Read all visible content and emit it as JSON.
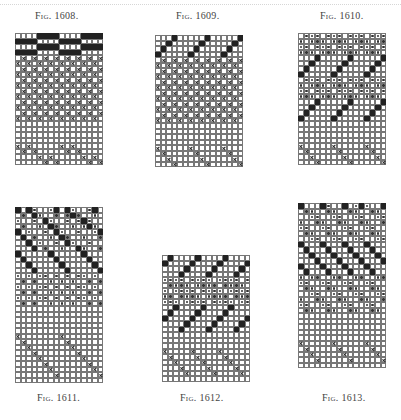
{
  "page": {
    "legend": {
      ".": "empty square",
      "#": "filled square",
      "x": "cross",
      "*": "dot"
    }
  },
  "figures": [
    {
      "id": "fig-1608",
      "caption": "Fig. 1608.",
      "left": 15,
      "top": 33,
      "caption_left": 35,
      "caption_top": 10,
      "rows": [
        "....####....####",
        "####....####....",
        "....####....####",
        "####....####....",
        ".x.x.x.x.x.x.x.x",
        "x.x.x.x.x.x.x.x.",
        ".x.x.x.x.x.x.x.x",
        "x.x.x.x.x.x.x.x.",
        ".x.x.x.x.x.x.x.x",
        "x.x.x.x.x.x.x.x.",
        ".x.x.x.x.x.x.x.x",
        "x.x.x.x.x.x.x.x.",
        ".x.x.x.x.x.x.x.x",
        "x.x.x.x.x.x.x.x.",
        ".x.x.x.x.x.x.x.x",
        "x.x.x.x.x.x.x.x.",
        "................",
        "................",
        "................",
        "................",
        "x.x.....x.x.....",
        ".x.x.....x.x....",
        "....x.x.....x.x.",
        ".....x.x.....x.x"
      ]
    },
    {
      "id": "fig-1609",
      "caption": "Fig. 1609.",
      "left": 155,
      "top": 35,
      "caption_left": 176,
      "caption_top": 10,
      "rows": [
        "...#.....#.....#",
        "..#.....#.....#.",
        ".#.....#.....#..",
        "#.....#.....#...",
        ".x.x.x.x.x.x.x.x",
        "x.x.x.x.x.x.x.x.",
        ".x.x.x.x.x.x.x.x",
        "x.x.x.x.x.x.x.x.",
        ".x.x.x.x.x.x.x.x",
        "x.x.x.x.x.x.x.x.",
        ".x.x.x.x.x.x.x.x",
        "x.x.x.x.x.x.x.x.",
        ".x.x.x.x.x.x.x.x",
        "x.x.x.x.x.x.x.x.",
        ".x.x.x.x.x.x.x.x",
        "x.x.x.x.x.x.x.x.",
        "................",
        "................",
        "................",
        "................",
        "x.....x.....x...",
        ".x.....x.....x..",
        "..x.....x.....x.",
        "...x.....x.....x"
      ]
    },
    {
      "id": "fig-1610",
      "caption": "Fig. 1610.",
      "left": 298,
      "top": 33,
      "caption_left": 320,
      "caption_top": 10,
      "rows": [
        ".***.***.***.***",
        "*.***.***.***.**",
        "**.***.***.***.*",
        "***.***.***.***.",
        "...#.....#.....#",
        "..#.....#.....#.",
        ".#.....#.....#..",
        "#.....#.....#...",
        ".***.***.***.***",
        "*.***.***.***.**",
        "**.***.***.***.*",
        "***.***.***.***.",
        "...#.....#.....#",
        "..#.....#.....#.",
        ".#.....#.....#..",
        "#.....#.....#...",
        "................",
        "................",
        "................",
        "................",
        "x.....x.....x...",
        ".x.....x.....x..",
        "..x.....x.....x.",
        "...x.....x.....x"
      ]
    },
    {
      "id": "fig-1611",
      "caption": "Fig. 1611.",
      "left": 15,
      "top": 207,
      "caption_left": 37,
      "caption_top": 392,
      "rows": [
        "#.#*..*#.#*..*#.",
        ".*.#*..*.*#*..*.",
        "*..*.#*..*.*#*..",
        ".*..*.#*..*.*#*.",
        "#.*..*.#*..*..*#",
        ".#.*..*.#*..*..*",
        "..#.*..*.#*..*..",
        "...#.*..*..#*..*",
        "#.....#.....#...",
        ".#.....#.....#..",
        "..#.....#.....#.",
        "...#.....#.....#",
        "*.*.**.*.*.**.*.",
        ".*.*..*.*.*..*.*",
        "*.*.**.*.*.**.*.",
        ".*.*..*.*.*..*.*",
        "*.*.**.*.*.**.*.",
        ".*.*..*.*.*..*.*",
        "................",
        "................",
        "................",
        "................",
        "................",
        "x.......x.......",
        ".x.......x......",
        "..x.......x.....",
        "...x.......x....",
        "....x.......x...",
        ".....x.......x..",
        "......x.......x.",
        ".......x.......x",
        "................"
      ]
    },
    {
      "id": "fig-1612",
      "caption": "Fig. 1612.",
      "left": 162,
      "top": 255,
      "caption_left": 180,
      "caption_top": 392,
      "rows": [
        ".#....#....#....",
        "#....#....#....#",
        "....#....#....#.",
        "...#....#....#..",
        "****.****.****.*",
        ".****.****.****.",
        "*.****.****.****",
        "**.****.****.***",
        "***.****.****.**",
        "..#....#....#...",
        ".#....#....#....",
        "#....#....#....#",
        "....#....#....#.",
        "...#....#....#..",
        "................",
        "................",
        "................",
        "x....x....x.....",
        ".x....x....x....",
        "..x....x....x...",
        "...x....x....x..",
        "....x....x....x.",
        "................"
      ]
    },
    {
      "id": "fig-1613",
      "caption": "Fig. 1613.",
      "left": 298,
      "top": 203,
      "caption_left": 322,
      "caption_top": 392,
      "rows": [
        "#...#*..#.*#*..#",
        ".**..**..**..**.",
        "..**..**..**..**",
        "*..**..**..**..*",
        "**..**..**..**..",
        ".**..**..**..**.",
        "..**..**..**..**",
        "#...#...#...#...",
        ".#...#...#...#..",
        "..#...#...#...#.",
        "...#...#...#...#",
        "#...#...#...#...",
        ".#...#...#...#..",
        "*.**..**..**..**",
        "**..**..**..**..",
        ".**..**..**..**.",
        "..**..**..**..**",
        "*..**..**..**..*",
        "**..**..**..**..",
        ".**..**..**..**.",
        "................",
        "................",
        "................",
        "................",
        "................",
        "x.....x.....x...",
        ".x.....x.....x..",
        "..x.....x.....x.",
        "...x.....x.....x",
        "................"
      ]
    }
  ]
}
